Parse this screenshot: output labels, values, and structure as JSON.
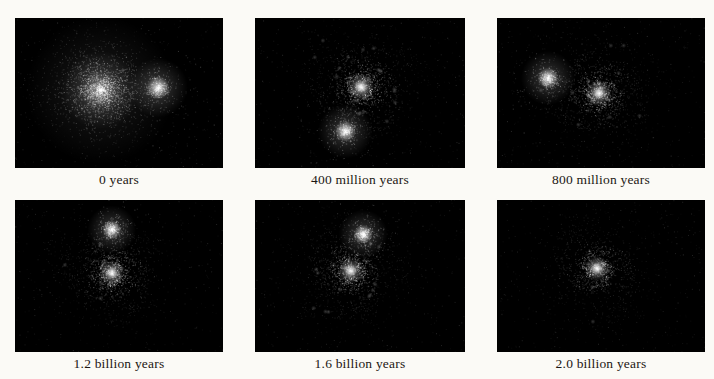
{
  "figure": {
    "background_color": "#fbfaf6",
    "panel_background_color": "#000000",
    "particle_color": "#ffffff",
    "caption_color": "#1b1713",
    "panels": [
      {
        "label": "0 years",
        "galaxies": [
          {
            "type": "cloud",
            "cx": 0.41,
            "cy": 0.48,
            "r": 0.34
          },
          {
            "type": "compact",
            "cx": 0.688,
            "cy": 0.465,
            "r": 0.055
          }
        ]
      },
      {
        "label": "400 million years",
        "galaxies": [
          {
            "type": "spiral",
            "cx": 0.505,
            "cy": 0.46,
            "r": 0.295,
            "rot": 250,
            "arms": 3,
            "sweep": 1.9
          },
          {
            "type": "compact",
            "cx": 0.43,
            "cy": 0.755,
            "r": 0.05
          }
        ]
      },
      {
        "label": "800 million years",
        "galaxies": [
          {
            "type": "spiral",
            "cx": 0.49,
            "cy": 0.5,
            "r": 0.285,
            "rot": 120,
            "arms": 3,
            "sweep": 1.7
          },
          {
            "type": "compact",
            "cx": 0.245,
            "cy": 0.4,
            "r": 0.05
          }
        ]
      },
      {
        "label": "1.2 billion years",
        "galaxies": [
          {
            "type": "spiral",
            "cx": 0.465,
            "cy": 0.48,
            "r": 0.27,
            "rot": 30,
            "arms": 3,
            "sweep": 1.7
          },
          {
            "type": "compact",
            "cx": 0.465,
            "cy": 0.195,
            "r": 0.045
          }
        ]
      },
      {
        "label": "1.6 billion years",
        "galaxies": [
          {
            "type": "spiral",
            "cx": 0.455,
            "cy": 0.465,
            "r": 0.28,
            "rot": 200,
            "arms": 3,
            "sweep": 1.7
          },
          {
            "type": "compact",
            "cx": 0.515,
            "cy": 0.225,
            "r": 0.045
          }
        ]
      },
      {
        "label": "2.0 billion years",
        "galaxies": [
          {
            "type": "spiral",
            "cx": 0.48,
            "cy": 0.45,
            "r": 0.27,
            "rot": 310,
            "arms": 2,
            "sweep": 1.8
          }
        ]
      }
    ]
  }
}
